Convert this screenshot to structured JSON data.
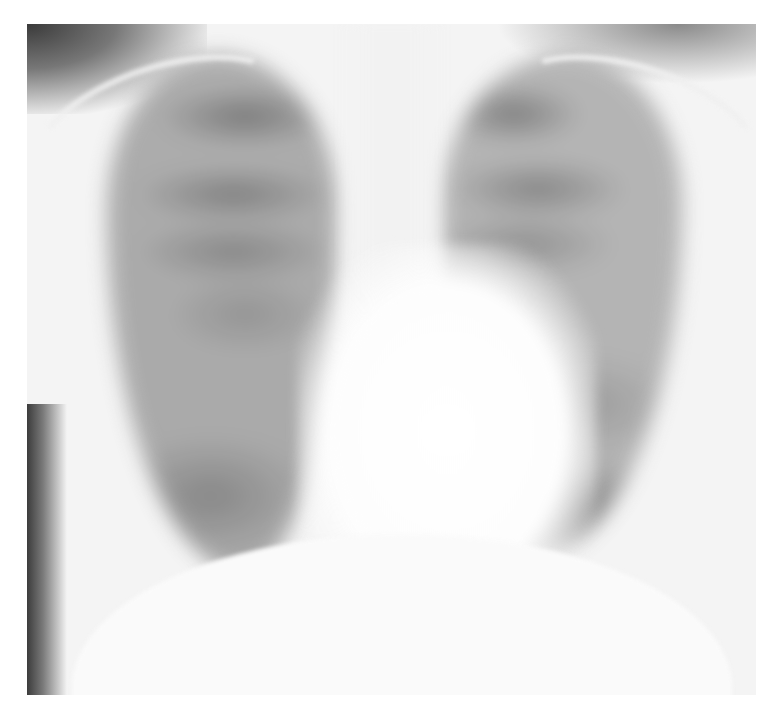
{
  "image": {
    "subject": "chest-xray-pa-view",
    "colors": {
      "background": "#ffffff",
      "film_base": "#f4f4f4",
      "dark_corner": "#3a3a3a",
      "lung_field": "#a6a6a6"
    }
  }
}
